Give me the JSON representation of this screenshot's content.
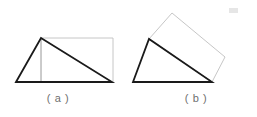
{
  "figure": {
    "background_color": "#ffffff",
    "solid_line_color": "#1a1a1a",
    "light_line_color": "#bfbfbf",
    "thin_line_color": "#a8a8a8",
    "caption_color": "#6f6f6f",
    "artifact_color": "#e6e6e6",
    "panels": [
      {
        "id": "a",
        "caption": "( a )",
        "description": "right-leaning triangle inscribed with an upright rectangle",
        "triangle": {
          "points": "16,82 41,38 112,82",
          "vertices": [
            [
              16,
              82
            ],
            [
              41,
              38
            ],
            [
              112,
              82
            ]
          ],
          "stroke_width": 1.8,
          "filled": false
        },
        "rectangle": {
          "points": "41,38 113,38 113,82 41,82",
          "vertices": [
            [
              41,
              38
            ],
            [
              113,
              38
            ],
            [
              113,
              82
            ],
            [
              41,
              82
            ]
          ],
          "stroke_width": 0.9,
          "rotation_deg": 0,
          "filled": false
        },
        "inner_line": {
          "from": [
            41,
            38
          ],
          "to": [
            41,
            82
          ],
          "stroke_width": 0.8
        }
      },
      {
        "id": "b",
        "caption": "( b )",
        "description": "right-leaning triangle with a tilted rectangle hinged on its hypotenuse",
        "triangle": {
          "points": "133,82 149,39 212,82",
          "vertices": [
            [
              133,
              82
            ],
            [
              149,
              39
            ],
            [
              212,
              82
            ]
          ],
          "stroke_width": 1.8,
          "filled": false
        },
        "rectangle": {
          "points": "149,39 172,13 225,57 212,82",
          "vertices": [
            [
              149,
              39
            ],
            [
              172,
              13
            ],
            [
              225,
              57
            ],
            [
              212,
              82
            ]
          ],
          "stroke_width": 0.9,
          "rotation_deg": -28,
          "filled": false
        }
      }
    ],
    "artifact": {
      "label": "smudge-mark",
      "x": 229,
      "y": 8,
      "width": 9,
      "height": 5
    }
  }
}
